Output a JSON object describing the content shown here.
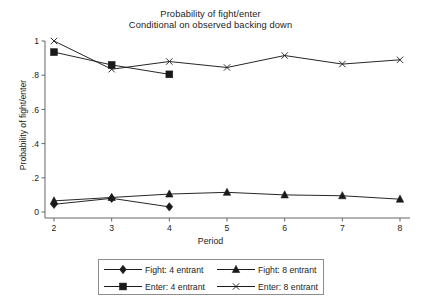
{
  "chart_data": {
    "type": "line",
    "title": "Probability of fight/enter",
    "subtitle": "Conditional on observed backing down",
    "xlabel": "Period",
    "ylabel": "Probability of fight/enter",
    "x": [
      2,
      3,
      4,
      5,
      6,
      7,
      8
    ],
    "xlim": [
      2,
      8
    ],
    "ylim": [
      0,
      1
    ],
    "xticks": [
      "2",
      "3",
      "4",
      "5",
      "6",
      "7",
      "8"
    ],
    "yticks": [
      "0",
      ".2",
      ".4",
      ".6",
      ".8",
      "1"
    ],
    "ytick_values": [
      0,
      0.2,
      0.4,
      0.6,
      0.8,
      1
    ],
    "grid": false,
    "legend_position": "bottom",
    "line_color": "#1a1a1a",
    "series": [
      {
        "name": "Fight: 4 entrant",
        "marker": "diamond",
        "x": [
          2,
          3,
          4
        ],
        "values": [
          0.045,
          0.08,
          0.03
        ]
      },
      {
        "name": "Enter: 4 entrant",
        "marker": "square",
        "x": [
          2,
          3,
          4
        ],
        "values": [
          0.935,
          0.86,
          0.805
        ]
      },
      {
        "name": "Fight: 8 entrant",
        "marker": "triangle",
        "x": [
          2,
          3,
          4,
          5,
          6,
          7,
          8
        ],
        "values": [
          0.065,
          0.085,
          0.105,
          0.115,
          0.1,
          0.095,
          0.075
        ]
      },
      {
        "name": "Enter: 8 entrant",
        "marker": "cross",
        "x": [
          2,
          3,
          4,
          5,
          6,
          7,
          8
        ],
        "values": [
          1.0,
          0.835,
          0.88,
          0.845,
          0.915,
          0.865,
          0.89
        ]
      }
    ]
  },
  "legend": {
    "rows": [
      [
        {
          "label": "Fight: 4 entrant",
          "marker": "diamond",
          "series_index": 0
        },
        {
          "label": "Fight: 8 entrant",
          "marker": "triangle",
          "series_index": 2
        }
      ],
      [
        {
          "label": "Enter: 4 entrant",
          "marker": "square",
          "series_index": 1
        },
        {
          "label": "Enter: 8 entrant",
          "marker": "cross",
          "series_index": 3
        }
      ]
    ]
  }
}
